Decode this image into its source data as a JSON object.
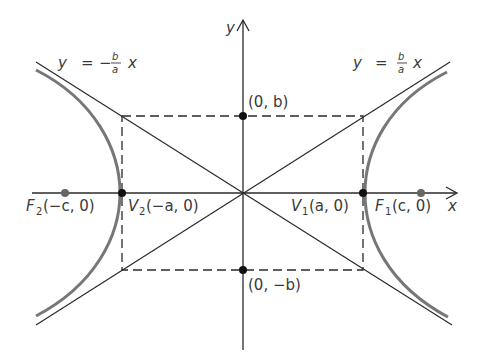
{
  "diagram": {
    "axes": {
      "x_label": "x",
      "y_label": "y"
    },
    "asymptotes": {
      "negative": {
        "lhs": "y",
        "eq": "=",
        "sign": "−",
        "num": "b",
        "den": "a",
        "var": "x"
      },
      "positive": {
        "lhs": "y",
        "eq": "=",
        "num": "b",
        "den": "a",
        "var": "x"
      }
    },
    "points": {
      "top": {
        "label": "(0, b)"
      },
      "bottom": {
        "label": "(0, −b)"
      },
      "v1": {
        "name": "V",
        "sub": "1",
        "coords": "(a, 0)"
      },
      "v2": {
        "name": "V",
        "sub": "2",
        "coords": "(−a, 0)"
      },
      "f1": {
        "name": "F",
        "sub": "1",
        "coords": "(c, 0)"
      },
      "f2": {
        "name": "F",
        "sub": "2",
        "coords": "(−c, 0)"
      }
    },
    "colors": {
      "line": "#2a2a2a",
      "curve": "#777777",
      "focus": "#666666",
      "vertex": "#111111"
    }
  }
}
